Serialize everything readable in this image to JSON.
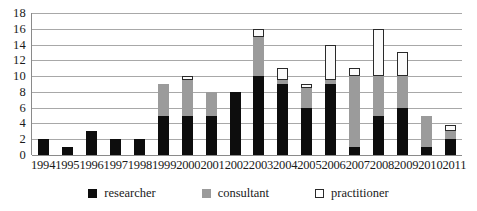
{
  "chart_data": {
    "type": "bar",
    "title": "",
    "subtitle": "",
    "xlabel": "",
    "ylabel": "",
    "stacked": true,
    "grid": true,
    "legend_position": "bottom",
    "ylim": [
      0,
      18
    ],
    "yticks": [
      18,
      16,
      14,
      12,
      10,
      8,
      6,
      4,
      2,
      0
    ],
    "categories": [
      "1994",
      "1995",
      "1996",
      "1997",
      "1998",
      "1999",
      "2000",
      "2001",
      "2002",
      "2003",
      "2004",
      "2005",
      "2006",
      "2007",
      "2008",
      "2009",
      "2010",
      "2011"
    ],
    "series": [
      {
        "name": "researcher",
        "color": "#0d0d0d",
        "values": [
          2,
          1,
          3,
          2,
          2,
          5,
          5,
          5,
          8,
          10,
          9,
          6,
          9,
          1,
          5,
          6,
          1,
          2
        ]
      },
      {
        "name": "consultant",
        "color": "#9b9b9b",
        "values": [
          0,
          0,
          0,
          0,
          0,
          4,
          4.5,
          3,
          0,
          5,
          0.5,
          2.5,
          0.5,
          9,
          5,
          4,
          4,
          1
        ]
      },
      {
        "name": "practitioner",
        "color": "#ffffff",
        "values": [
          0,
          0,
          0,
          0,
          0,
          0,
          0.5,
          0,
          0,
          1,
          1.5,
          0.5,
          4.5,
          1,
          6,
          3,
          0,
          0.8
        ]
      }
    ],
    "totals": [
      2,
      1,
      3,
      2,
      2,
      9,
      10,
      8,
      8,
      16,
      11,
      9,
      14,
      11,
      16,
      13,
      5,
      3.8
    ]
  },
  "legend": {
    "items": [
      {
        "label": "researcher",
        "swatch": "filled-black-square-icon"
      },
      {
        "label": "consultant",
        "swatch": "filled-gray-square-icon"
      },
      {
        "label": "practitioner",
        "swatch": "outlined-white-square-icon"
      }
    ]
  }
}
